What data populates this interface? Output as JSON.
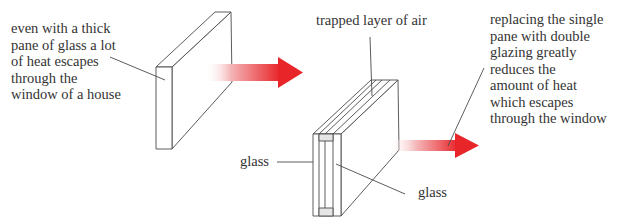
{
  "diagram": {
    "colors": {
      "line": "#4a4a4a",
      "arrow": "#e8262a",
      "arrow_faded": "#f6d0d1",
      "text": "#333333"
    },
    "single_pane": {
      "label_lines": [
        "even with a thick",
        "pane of glass a lot",
        "of heat escapes",
        "through the",
        "window of a house"
      ],
      "arrow": "large heat loss"
    },
    "double_glazing": {
      "air_label": "trapped layer of air",
      "glass_label_left": "glass",
      "glass_label_right": "glass",
      "label_lines": [
        "replacing the single",
        "pane with double",
        "glazing greatly",
        "reduces the",
        "amount of heat",
        "which escapes",
        "through the window"
      ],
      "arrow": "reduced heat loss"
    }
  }
}
